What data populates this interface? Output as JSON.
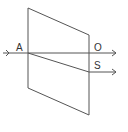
{
  "diagram": {
    "type": "double-refraction",
    "labels": {
      "entry_point": "A",
      "ordinary_ray": "O",
      "extraordinary_ray": "S"
    },
    "colors": {
      "stroke": "#555555",
      "text": "#333333",
      "background": "#ffffff"
    },
    "crystal": {
      "shape": "parallelogram",
      "points": [
        [
          28,
          8
        ],
        [
          89,
          35
        ],
        [
          89,
          115
        ],
        [
          28,
          88
        ]
      ]
    },
    "rays": [
      {
        "name": "incident",
        "from": [
          3,
          53
        ],
        "to": [
          28,
          53
        ]
      },
      {
        "name": "ordinary",
        "label": "O",
        "from": [
          28,
          53
        ],
        "to": [
          116,
          53
        ]
      },
      {
        "name": "extraordinary-inside",
        "from": [
          28,
          53
        ],
        "to": [
          89,
          72
        ]
      },
      {
        "name": "extraordinary",
        "label": "S",
        "from": [
          89,
          72
        ],
        "to": [
          116,
          72
        ]
      }
    ]
  }
}
